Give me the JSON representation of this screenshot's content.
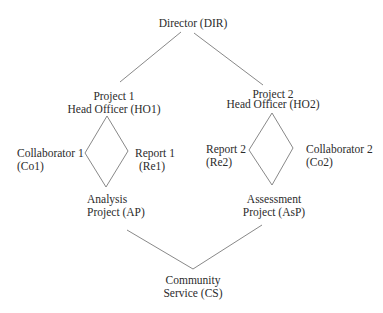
{
  "diagram": {
    "type": "hierarchy",
    "line_color": "#7a7a7a",
    "text_color": "#2b2b2b",
    "nodes": {
      "director": {
        "line1": "Director (DIR)"
      },
      "ho1": {
        "line1": "Project 1",
        "line2": "Head Officer (HO1)"
      },
      "ho2": {
        "line1": "Project 2",
        "line2": "Head Officer (HO2)"
      },
      "co1": {
        "line1": "Collaborator 1",
        "line2": "(Co1)"
      },
      "re1": {
        "line1": "Report 1",
        "line2": "(Re1)"
      },
      "re2": {
        "line1": "Report 2",
        "line2": "(Re2)"
      },
      "co2": {
        "line1": "Collaborator 2",
        "line2": "(Co2)"
      },
      "ap": {
        "line1": "Analysis",
        "line2": "Project (AP)"
      },
      "asp": {
        "line1": "Assessment",
        "line2": "Project (AsP)"
      },
      "cs": {
        "line1": "Community",
        "line2": "Service (CS)"
      }
    },
    "edges": [
      [
        "DIR",
        "HO1"
      ],
      [
        "DIR",
        "HO2"
      ],
      [
        "HO1",
        "Co1"
      ],
      [
        "HO1",
        "Re1"
      ],
      [
        "Co1",
        "AP"
      ],
      [
        "Re1",
        "AP"
      ],
      [
        "HO2",
        "Re2"
      ],
      [
        "HO2",
        "Co2"
      ],
      [
        "Re2",
        "AsP"
      ],
      [
        "Co2",
        "AsP"
      ],
      [
        "AP",
        "CS"
      ],
      [
        "AsP",
        "CS"
      ]
    ]
  }
}
